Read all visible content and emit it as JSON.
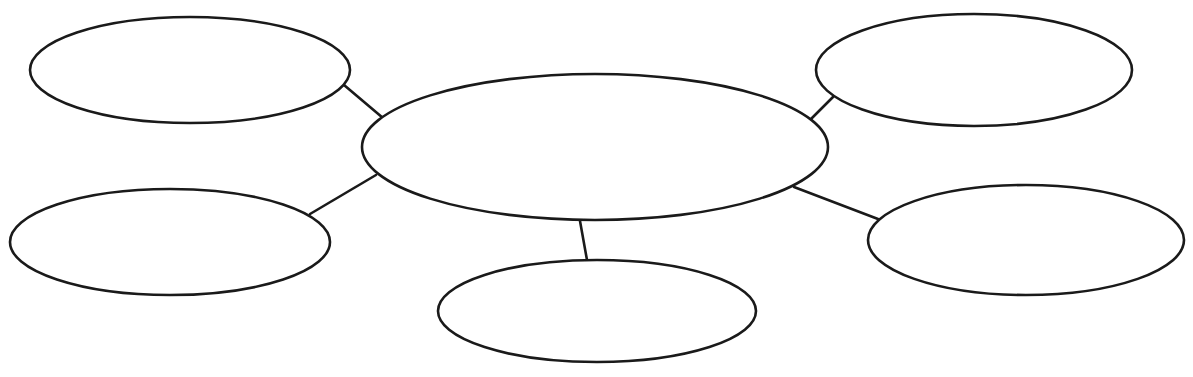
{
  "diagram": {
    "type": "bubble-map",
    "background": "#ffffff",
    "stroke_color": "#1a1a1a",
    "center": {
      "id": "center",
      "label": "",
      "cx": 595,
      "cy": 147,
      "rx": 233,
      "ry": 73
    },
    "nodes": [
      {
        "id": "top-left",
        "label": "",
        "cx": 190,
        "cy": 70,
        "rx": 160,
        "ry": 53
      },
      {
        "id": "top-right",
        "label": "",
        "cx": 974,
        "cy": 70,
        "rx": 158,
        "ry": 56
      },
      {
        "id": "bottom-left",
        "label": "",
        "cx": 170,
        "cy": 242,
        "rx": 160,
        "ry": 53
      },
      {
        "id": "bottom-center",
        "label": "",
        "cx": 597,
        "cy": 311,
        "rx": 159,
        "ry": 51
      },
      {
        "id": "bottom-right",
        "label": "",
        "cx": 1026,
        "cy": 240,
        "rx": 158,
        "ry": 55
      }
    ],
    "connectors": [
      {
        "from": "top-left",
        "to": "center",
        "x1": 344,
        "y1": 85,
        "x2": 383,
        "y2": 118
      },
      {
        "from": "bottom-left",
        "to": "center",
        "x1": 310,
        "y1": 214,
        "x2": 376,
        "y2": 175
      },
      {
        "from": "top-right",
        "to": "center",
        "x1": 833,
        "y1": 97,
        "x2": 811,
        "y2": 119
      },
      {
        "from": "bottom-right",
        "to": "center",
        "x1": 794,
        "y1": 187,
        "x2": 878,
        "y2": 219
      },
      {
        "from": "bottom-center",
        "to": "center",
        "x1": 580,
        "y1": 221,
        "x2": 587,
        "y2": 260
      }
    ]
  }
}
